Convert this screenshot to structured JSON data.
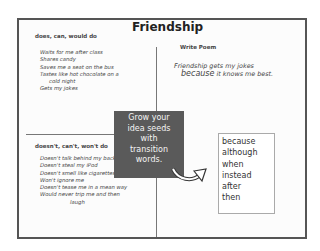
{
  "title": "Friendship",
  "quadrants": {
    "does": {
      "heading": "does, can, would do",
      "items": [
        "Waits for me after class",
        "Shares candy",
        "Saves me a seat on the bus",
        "Tastes like hot chocolate on a",
        "cold night",
        "Gets my jokes"
      ]
    },
    "write_poem": {
      "heading": "Write Poem",
      "line1": "Friendship gets my jokes",
      "line2_connector": "because",
      "line2_rest": " it knows me best."
    },
    "doesnt": {
      "heading": "doesn't, can't, won't do",
      "items": [
        "Doesn't talk behind my back",
        "Doesn't steal my iPod",
        "Doesn't smell like cigarettes",
        "Won't ignore me",
        "Doesn't tease me in a mean way",
        "Would never trip me and then",
        "laugh"
      ]
    }
  },
  "callout": {
    "lines": [
      "Grow your",
      "idea seeds",
      "with",
      "transition",
      "words."
    ],
    "background": "#5a5a5a"
  },
  "transition_words": [
    "because",
    "although",
    "when",
    "instead",
    "after",
    "then"
  ]
}
